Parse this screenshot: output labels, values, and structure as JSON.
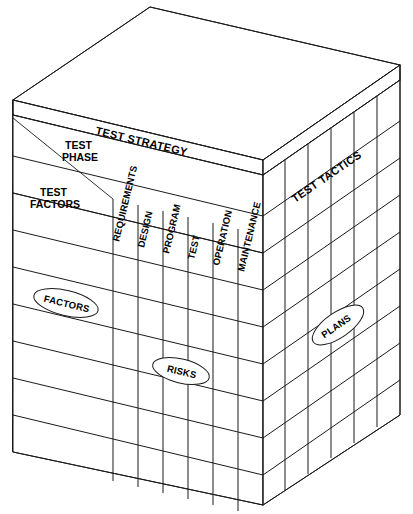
{
  "diagram": {
    "type": "3d-matrix-cube",
    "colors": {
      "edge": "#1a1a1a",
      "grid": "#444444",
      "face_fill": "#ffffff",
      "background": "#ffffff"
    },
    "faces": {
      "top": {
        "name": "top-face",
        "label": ""
      },
      "front": {
        "name": "front-face",
        "label": "TEST STRATEGY"
      },
      "right": {
        "name": "right-face",
        "label": "TEST TACTICS"
      }
    },
    "header_cell": {
      "row_axis_label": "TEST FACTORS",
      "column_axis_label": "TEST PHASE",
      "divider": "diagonal"
    },
    "banner": {
      "label": "TEST STRATEGY"
    },
    "columns": [
      {
        "label": "REQUIREMENTS"
      },
      {
        "label": "DESIGN"
      },
      {
        "label": "PROGRAM"
      },
      {
        "label": "TEST"
      },
      {
        "label": "OPERATION"
      },
      {
        "label": "MAINTENANCE"
      }
    ],
    "right_face": {
      "label": "TEST TACTICS",
      "column_count": 5,
      "row_count": 8
    },
    "front_face": {
      "row_count": 8,
      "column_count": 6,
      "label_column_count": 1
    },
    "callouts": [
      {
        "label": "FACTORS",
        "face": "front-face",
        "name": "callout-factors"
      },
      {
        "label": "RISKS",
        "face": "front-face",
        "name": "callout-risks"
      },
      {
        "label": "PLANS",
        "face": "right-face",
        "name": "callout-plans"
      }
    ]
  }
}
